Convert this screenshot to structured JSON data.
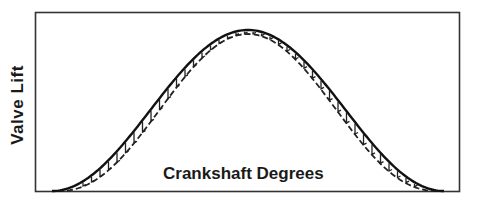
{
  "figure": {
    "y_axis_label": "Valve Lift",
    "x_axis_label": "Crankshaft Degrees"
  },
  "chart_data": {
    "type": "line",
    "title": "",
    "xlabel": "Crankshaft Degrees",
    "ylabel": "Valve Lift",
    "grid": false,
    "legend": null,
    "ticks": "none",
    "series": [
      {
        "name": "solid-profile",
        "style": "solid",
        "shape": "bell / cam lift curve",
        "x": [
          0,
          0.1,
          0.2,
          0.3,
          0.4,
          0.5,
          0.6,
          0.7,
          0.8,
          0.9,
          1.0
        ],
        "values": [
          0,
          0.1,
          0.35,
          0.68,
          0.92,
          1.0,
          0.92,
          0.68,
          0.35,
          0.1,
          0
        ]
      },
      {
        "name": "dashed-profile",
        "style": "dashed",
        "shape": "slightly lower / lagging bell curve",
        "x": [
          0,
          0.1,
          0.2,
          0.3,
          0.4,
          0.5,
          0.6,
          0.7,
          0.8,
          0.9,
          1.0
        ],
        "values": [
          0,
          0.07,
          0.28,
          0.6,
          0.88,
          0.98,
          0.88,
          0.6,
          0.28,
          0.07,
          0
        ]
      }
    ],
    "annotations": [
      "vertical hatch marks shade the gap between solid and dashed curves"
    ]
  }
}
